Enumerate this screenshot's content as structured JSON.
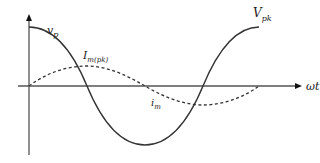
{
  "diagram": {
    "type": "waveform",
    "axes": {
      "x_label": "ωt",
      "y_arrow": true
    },
    "curves": [
      {
        "name": "voltage",
        "style": "solid",
        "shape": "cosine",
        "label": "v_p",
        "peak_label": "V_pk"
      },
      {
        "name": "magnetizing-current",
        "style": "dashed",
        "shape": "sine",
        "label": "i_m",
        "peak_label": "I_m(pk)"
      }
    ],
    "labels": {
      "vp_main": "v",
      "vp_sub": "p",
      "vpk_main": "V",
      "vpk_sub": "pk",
      "impk_main": "I",
      "impk_sub": "m(pk)",
      "im_main": "i",
      "im_sub": "m",
      "omega_t": "ωt"
    },
    "colors": {
      "line": "#333333",
      "axis": "#555555",
      "background": "#ffffff"
    }
  }
}
